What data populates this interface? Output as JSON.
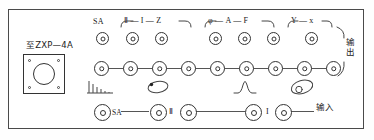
{
  "panel": {
    "device_label": "至ZXP—4A",
    "output_label": "输出",
    "input_label": "输入"
  },
  "groups": [
    {
      "name": "group-sa",
      "label": "SA",
      "bracket": false
    },
    {
      "name": "group-iiz",
      "label": "Ⅱ — I — Z",
      "bracket": true
    },
    {
      "name": "group-af",
      "label": "φ — A — F",
      "bracket": true
    },
    {
      "name": "group-yx",
      "label": "Y — x",
      "bracket": true
    }
  ],
  "top_row": {
    "name": "top-jack-row",
    "jacks": [
      {
        "name": "top-jack-sa",
        "x": 96,
        "y": 32
      },
      {
        "name": "top-jack-ii",
        "x": 126,
        "y": 32
      },
      {
        "name": "top-jack-i",
        "x": 155,
        "y": 32
      },
      {
        "name": "top-jack-z",
        "x": 209,
        "y": 32
      },
      {
        "name": "top-jack-phi",
        "x": 238,
        "y": 32
      },
      {
        "name": "top-jack-a",
        "x": 267,
        "y": 32
      },
      {
        "name": "top-jack-f",
        "x": 305,
        "y": 32
      }
    ]
  },
  "middle_row": {
    "name": "middle-jack-row",
    "jacks": [
      {
        "name": "mid-jack-1",
        "x": 94,
        "y": 61
      },
      {
        "name": "mid-jack-2",
        "x": 123,
        "y": 61
      },
      {
        "name": "mid-jack-3",
        "x": 152,
        "y": 61
      },
      {
        "name": "mid-jack-4",
        "x": 181,
        "y": 61
      },
      {
        "name": "mid-jack-5",
        "x": 210,
        "y": 61
      },
      {
        "name": "mid-jack-6",
        "x": 239,
        "y": 61
      },
      {
        "name": "mid-jack-7",
        "x": 268,
        "y": 61
      },
      {
        "name": "mid-jack-8",
        "x": 297,
        "y": 61
      },
      {
        "name": "mid-jack-9",
        "x": 326,
        "y": 61
      }
    ]
  },
  "bottom_row": {
    "name": "bottom-jack-row",
    "jacks": [
      {
        "name": "bot-jack-sa",
        "x": 94,
        "y": 104
      },
      {
        "name": "bot-jack-ii-in",
        "x": 150,
        "y": 104
      },
      {
        "name": "bot-jack-ii-out",
        "x": 180,
        "y": 104
      },
      {
        "name": "bot-jack-i-in",
        "x": 245,
        "y": 104
      },
      {
        "name": "bot-jack-i-out",
        "x": 275,
        "y": 104
      }
    ],
    "labels": [
      {
        "name": "bottom-label-sa",
        "text": "SA",
        "x": 110,
        "y": 108
      },
      {
        "name": "bottom-label-ii",
        "text": "Ⅱ",
        "x": 171,
        "y": 107
      },
      {
        "name": "bottom-label-i",
        "text": "I",
        "x": 268,
        "y": 107
      }
    ]
  },
  "waveforms": [
    {
      "name": "waveform-pulse-train",
      "type": "pulse-train"
    },
    {
      "name": "waveform-ellipse-dot",
      "type": "ellipse-dot"
    },
    {
      "name": "waveform-bell-curve",
      "type": "bell"
    },
    {
      "name": "waveform-lissajous",
      "type": "lissajous"
    }
  ]
}
